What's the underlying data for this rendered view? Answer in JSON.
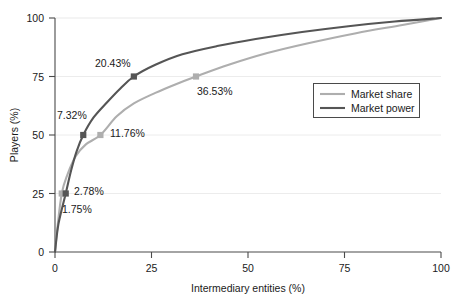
{
  "chart_data": {
    "type": "line",
    "title": "",
    "xlabel": "Intermediary entities (%)",
    "ylabel": "Players (%)",
    "xlim": [
      0,
      100
    ],
    "ylim": [
      0,
      100
    ],
    "xticks": [
      0,
      25,
      50,
      75,
      100
    ],
    "yticks": [
      0,
      25,
      50,
      75,
      100
    ],
    "xtick_labels": [
      "0",
      "25",
      "50",
      "75",
      "100"
    ],
    "ytick_labels": [
      "0",
      "25",
      "50",
      "75",
      "100"
    ],
    "grid": true,
    "legend_position": "right",
    "series": [
      {
        "name": "Market share",
        "color": "#aeaeae",
        "x": [
          0,
          0.6,
          1.75,
          3.2,
          5.4,
          8.0,
          11.76,
          16.0,
          20.43,
          26.0,
          31.0,
          36.53,
          45.0,
          55.0,
          65.0,
          78.0,
          90.0,
          100
        ],
        "y": [
          0,
          10,
          25,
          33,
          41,
          46,
          50,
          58,
          63.5,
          68,
          71.5,
          75,
          80,
          85,
          89,
          93.5,
          97,
          100
        ],
        "markers": [
          {
            "x": 1.75,
            "y": 25,
            "label": "1.75%"
          },
          {
            "x": 11.76,
            "y": 50,
            "label": "11.76%"
          },
          {
            "x": 36.53,
            "y": 75,
            "label": "36.53%"
          }
        ]
      },
      {
        "name": "Market power",
        "color": "#555555",
        "x": [
          0,
          0.9,
          2.78,
          4.2,
          5.6,
          7.32,
          10.0,
          13.5,
          17.0,
          20.43,
          26.0,
          33.0,
          42.0,
          52.0,
          64.0,
          76.0,
          88.0,
          100
        ],
        "y": [
          0,
          12,
          25,
          35,
          43,
          50,
          57.5,
          64,
          70,
          75,
          80,
          84.5,
          88,
          91,
          94,
          96.5,
          98.5,
          100
        ],
        "markers": [
          {
            "x": 2.78,
            "y": 25,
            "label": "2.78%"
          },
          {
            "x": 7.32,
            "y": 50,
            "label": "7.32%"
          },
          {
            "x": 20.43,
            "y": 75,
            "label": "20.43%"
          }
        ]
      }
    ],
    "annotations": [
      {
        "text": "7.32%",
        "x_px": 57,
        "y_px": 119,
        "series": "Market power"
      },
      {
        "text": "20.43%",
        "x_px": 95,
        "y_px": 67,
        "series": "Market power"
      },
      {
        "text": "2.78%",
        "x_px": 74,
        "y_px": 195,
        "series": "Market power"
      },
      {
        "text": "1.75%",
        "x_px": 62,
        "y_px": 213,
        "series": "Market share"
      },
      {
        "text": "11.76%",
        "x_px": 110,
        "y_px": 137,
        "series": "Market share"
      },
      {
        "text": "36.53%",
        "x_px": 197,
        "y_px": 95,
        "series": "Market share"
      }
    ],
    "legend": [
      {
        "label": "Market share",
        "color": "#aeaeae"
      },
      {
        "label": "Market power",
        "color": "#555555"
      }
    ]
  }
}
